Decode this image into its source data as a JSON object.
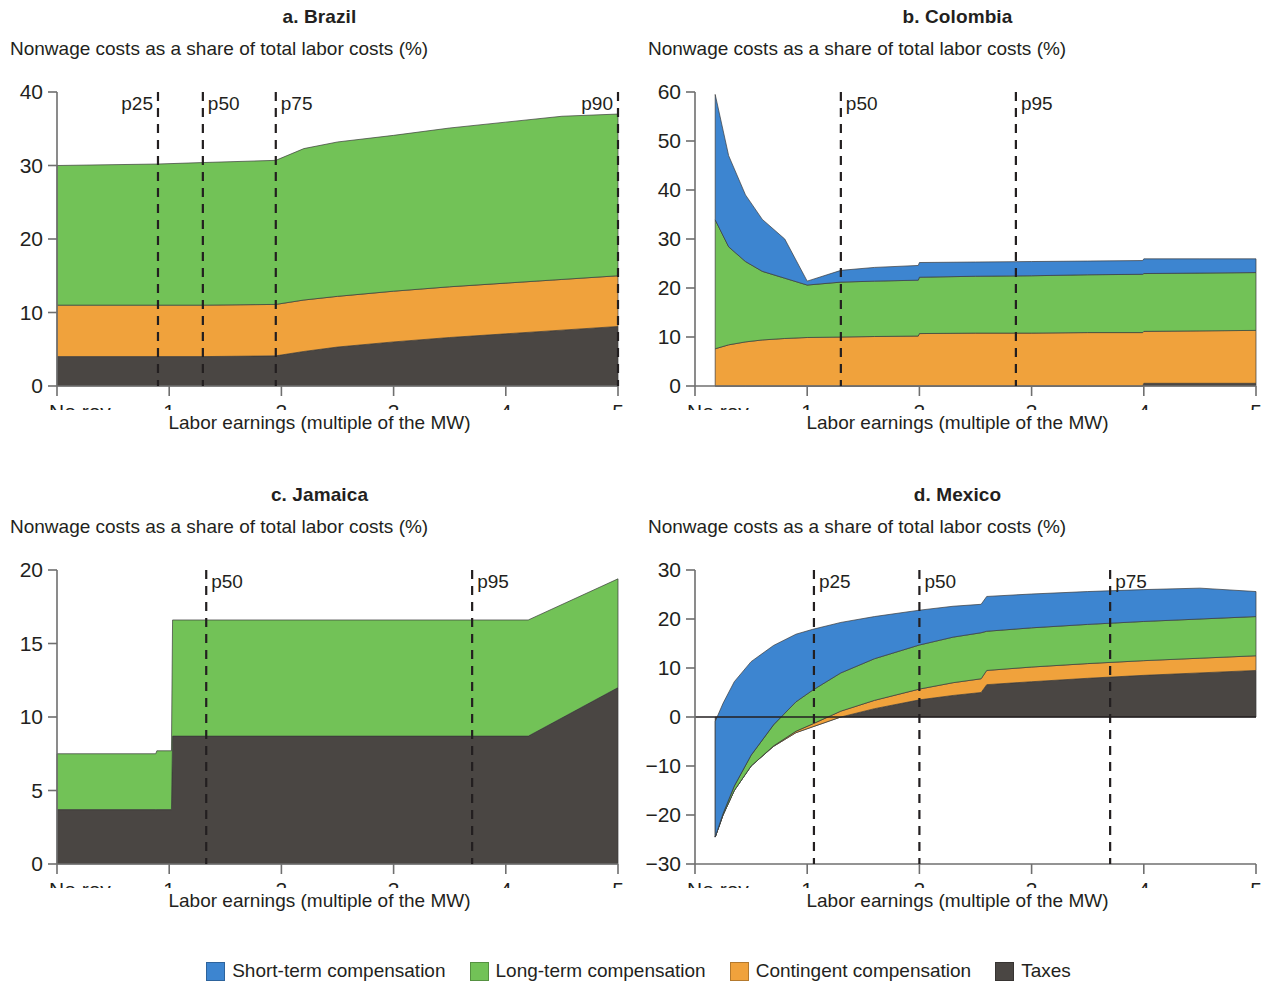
{
  "figure": {
    "y_axis_title": "Nonwage costs as a share of total labor costs (%)",
    "x_axis_title": "Labor earnings (multiple of the MW)",
    "no_rev_label": "No rev."
  },
  "legend": {
    "items": [
      {
        "label": "Short-term compensation",
        "color": "#3d85d0"
      },
      {
        "label": "Long-term compensation",
        "color": "#72c257"
      },
      {
        "label": "Contingent compensation",
        "color": "#f0a23c"
      },
      {
        "label": "Taxes",
        "color": "#4a4643"
      }
    ]
  },
  "chart_data": [
    {
      "id": "a",
      "type": "area",
      "title": "a. Brazil",
      "xlabel": "Labor earnings (multiple of the MW)",
      "ylabel": "Nonwage costs as a share of total labor costs (%)",
      "xlim": [
        0,
        5
      ],
      "ylim": [
        0,
        40
      ],
      "yticks": [
        0,
        10,
        20,
        30,
        40
      ],
      "xticks": [
        "No rev.",
        "1",
        "2",
        "3",
        "4",
        "5"
      ],
      "grid": false,
      "legend_position": "bottom",
      "stack_order": [
        "Taxes",
        "Contingent compensation",
        "Long-term compensation",
        "Short-term compensation"
      ],
      "x": [
        0.0,
        0.9,
        1.3,
        1.95,
        2.2,
        2.5,
        3.0,
        3.5,
        4.0,
        4.5,
        5.0
      ],
      "series": [
        {
          "name": "Taxes",
          "color": "#4a4643",
          "values": [
            4.0,
            4.0,
            4.0,
            4.1,
            4.7,
            5.3,
            6.0,
            6.6,
            7.1,
            7.6,
            8.1
          ]
        },
        {
          "name": "Contingent compensation",
          "color": "#f0a23c",
          "values": [
            7.0,
            7.0,
            7.0,
            7.0,
            7.0,
            6.9,
            6.9,
            6.9,
            6.9,
            6.9,
            6.9
          ]
        },
        {
          "name": "Long-term compensation",
          "color": "#72c257",
          "values": [
            19.0,
            19.2,
            19.4,
            19.6,
            20.6,
            21.0,
            21.2,
            21.6,
            21.9,
            22.2,
            22.0
          ]
        },
        {
          "name": "Short-term compensation",
          "color": "#3d85d0",
          "values": [
            0,
            0,
            0,
            0,
            0,
            0,
            0,
            0,
            0,
            0,
            0
          ]
        }
      ],
      "annotations": [
        {
          "label": "p25",
          "x": 0.9,
          "align": "left"
        },
        {
          "label": "p50",
          "x": 1.3,
          "align": "right"
        },
        {
          "label": "p75",
          "x": 1.95,
          "align": "right"
        },
        {
          "label": "p90",
          "x": 5.0,
          "align": "left"
        }
      ]
    },
    {
      "id": "b",
      "type": "area",
      "title": "b. Colombia",
      "xlabel": "Labor earnings (multiple of the MW)",
      "ylabel": "Nonwage costs as a share of total labor costs (%)",
      "xlim": [
        0,
        5
      ],
      "ylim": [
        0,
        60
      ],
      "yticks": [
        0,
        10,
        20,
        30,
        40,
        50,
        60
      ],
      "xticks": [
        "No rev.",
        "1",
        "2",
        "3",
        "4",
        "5"
      ],
      "grid": false,
      "legend_position": "bottom",
      "stack_order": [
        "Taxes",
        "Contingent compensation",
        "Long-term compensation",
        "Short-term compensation"
      ],
      "x": [
        0.18,
        0.3,
        0.45,
        0.6,
        0.8,
        1.0,
        1.3,
        1.6,
        1.99,
        2.0,
        2.5,
        3.0,
        3.5,
        3.99,
        4.0,
        4.5,
        5.0
      ],
      "series": [
        {
          "name": "Taxes",
          "color": "#4a4643",
          "values": [
            0,
            0,
            0,
            0,
            0,
            0,
            0,
            0,
            0,
            0,
            0,
            0,
            0,
            0,
            0.55,
            0.55,
            0.55
          ]
        },
        {
          "name": "Contingent compensation",
          "color": "#f0a23c",
          "values": [
            7.6,
            8.4,
            9.0,
            9.4,
            9.7,
            9.9,
            10.0,
            10.1,
            10.2,
            10.7,
            10.8,
            10.8,
            10.9,
            10.9,
            10.6,
            10.7,
            10.8
          ]
        },
        {
          "name": "Long-term compensation",
          "color": "#72c257",
          "values": [
            26.3,
            20.0,
            16.4,
            14.0,
            12.3,
            10.7,
            11.2,
            11.3,
            11.4,
            11.5,
            11.6,
            11.7,
            11.8,
            11.9,
            11.8,
            11.8,
            11.8
          ]
        },
        {
          "name": "Short-term compensation",
          "color": "#3d85d0",
          "values": [
            25.6,
            18.6,
            13.6,
            10.6,
            8.0,
            0.8,
            2.4,
            2.8,
            3.0,
            3.0,
            2.9,
            2.9,
            2.8,
            2.8,
            3.0,
            2.9,
            2.8
          ]
        }
      ],
      "annotations": [
        {
          "label": "p50",
          "x": 1.3,
          "align": "right"
        },
        {
          "label": "p95",
          "x": 2.86,
          "align": "right"
        }
      ]
    },
    {
      "id": "c",
      "type": "area",
      "title": "c. Jamaica",
      "xlabel": "Labor earnings (multiple of the MW)",
      "ylabel": "Nonwage costs as a share of total labor costs (%)",
      "xlim": [
        0,
        5
      ],
      "ylim": [
        0,
        20
      ],
      "yticks": [
        0,
        5,
        10,
        15,
        20
      ],
      "xticks": [
        "No rev.",
        "1",
        "2",
        "3",
        "4",
        "5"
      ],
      "grid": false,
      "legend_position": "bottom",
      "stack_order": [
        "Taxes",
        "Contingent compensation",
        "Long-term compensation",
        "Short-term compensation"
      ],
      "x": [
        0.0,
        0.88,
        0.89,
        1.02,
        1.03,
        3.7,
        4.2,
        5.0
      ],
      "series": [
        {
          "name": "Taxes",
          "color": "#4a4643",
          "values": [
            3.7,
            3.7,
            3.7,
            3.7,
            8.7,
            8.7,
            8.7,
            12.0
          ]
        },
        {
          "name": "Contingent compensation",
          "color": "#f0a23c",
          "values": [
            0,
            0,
            0,
            0,
            0,
            0,
            0,
            0
          ]
        },
        {
          "name": "Long-term compensation",
          "color": "#72c257",
          "values": [
            3.8,
            3.8,
            4.0,
            4.0,
            7.9,
            7.9,
            7.9,
            7.4
          ]
        },
        {
          "name": "Short-term compensation",
          "color": "#3d85d0",
          "values": [
            0,
            0,
            0,
            0,
            0,
            0,
            0,
            0
          ]
        }
      ],
      "annotations": [
        {
          "label": "p50",
          "x": 1.33,
          "align": "right"
        },
        {
          "label": "p95",
          "x": 3.7,
          "align": "right"
        }
      ]
    },
    {
      "id": "d",
      "type": "area",
      "title": "d. Mexico",
      "xlabel": "Labor earnings (multiple of the MW)",
      "ylabel": "Nonwage costs as a share of total labor costs (%)",
      "xlim": [
        0,
        5
      ],
      "ylim": [
        -30,
        30
      ],
      "yticks": [
        -30,
        -20,
        -10,
        0,
        10,
        20,
        30
      ],
      "xticks": [
        "No rev.",
        "1",
        "2",
        "3",
        "4",
        "5"
      ],
      "grid": false,
      "legend_position": "bottom",
      "stack_order": [
        "Taxes",
        "Contingent compensation",
        "Long-term compensation",
        "Short-term compensation"
      ],
      "x": [
        0.18,
        0.25,
        0.35,
        0.5,
        0.7,
        0.9,
        1.05,
        1.3,
        1.6,
        2.0,
        2.3,
        2.55,
        2.6,
        3.0,
        3.5,
        4.0,
        4.5,
        5.0
      ],
      "series": [
        {
          "name": "Taxes",
          "color": "#4a4643",
          "values": [
            -24.5,
            -20.0,
            -15.0,
            -10.0,
            -6.0,
            -3.2,
            -2.0,
            0.0,
            1.7,
            3.5,
            4.4,
            5.0,
            6.6,
            7.2,
            7.9,
            8.5,
            9.0,
            9.5
          ]
        },
        {
          "name": "Contingent compensation",
          "color": "#f0a23c",
          "values": [
            0.0,
            0.0,
            0.0,
            0.0,
            0.1,
            0.3,
            0.6,
            1.2,
            1.7,
            2.2,
            2.6,
            2.8,
            2.9,
            3.0,
            3.0,
            3.0,
            3.0,
            3.0
          ]
        },
        {
          "name": "Long-term compensation",
          "color": "#72c257",
          "values": [
            0.0,
            0.3,
            0.9,
            2.2,
            4.3,
            6.0,
            6.9,
            7.8,
            8.5,
            9.0,
            9.3,
            9.4,
            8.0,
            8.0,
            8.0,
            8.0,
            8.0,
            8.0
          ]
        },
        {
          "name": "Short-term compensation",
          "color": "#3d85d0",
          "values": [
            23.6,
            22.5,
            21.3,
            19.1,
            16.2,
            13.8,
            12.4,
            10.3,
            8.6,
            7.1,
            6.3,
            5.8,
            7.1,
            6.9,
            6.7,
            6.5,
            6.3,
            5.1
          ]
        }
      ],
      "annotations": [
        {
          "label": "p25",
          "x": 1.06,
          "align": "right"
        },
        {
          "label": "p50",
          "x": 2.0,
          "align": "right"
        },
        {
          "label": "p75",
          "x": 3.7,
          "align": "right"
        }
      ]
    }
  ]
}
